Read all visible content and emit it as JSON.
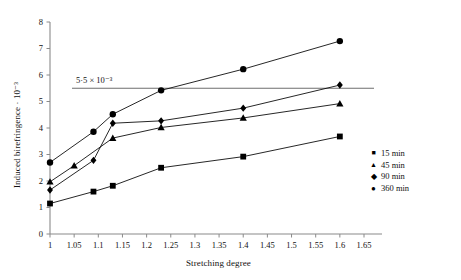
{
  "axes": {
    "ylabel": "Induced birefringence · 10⁻³",
    "xlabel": "Stretching degree",
    "yticks": [
      "0",
      "1",
      "2",
      "3",
      "4",
      "5",
      "6",
      "7",
      "8"
    ],
    "xticks": [
      "1",
      "1.05",
      "1.1",
      "1.15",
      "1.2",
      "1.25",
      "1.3",
      "1.35",
      "1.4",
      "1.45",
      "1.5",
      "1.55",
      "1.6",
      "1.65"
    ]
  },
  "annotation": {
    "reference_line_label": "5·5 × 10⁻³"
  },
  "legend": {
    "items": [
      {
        "label": "15 min",
        "marker": "square-marker"
      },
      {
        "label": "45 min",
        "marker": "triangle-marker"
      },
      {
        "label": "90 min",
        "marker": "diamond-marker"
      },
      {
        "label": "360 min",
        "marker": "circle-marker"
      }
    ]
  },
  "chart_data": {
    "type": "scatter",
    "title": "",
    "xlabel": "Stretching degree",
    "ylabel": "Induced birefringence · 10⁻³",
    "xlim": [
      1,
      1.65
    ],
    "ylim": [
      0,
      8
    ],
    "xticks": [
      1,
      1.05,
      1.1,
      1.15,
      1.2,
      1.25,
      1.3,
      1.35,
      1.4,
      1.45,
      1.5,
      1.55,
      1.6,
      1.65
    ],
    "yticks": [
      0,
      1,
      2,
      3,
      4,
      5,
      6,
      7,
      8
    ],
    "grid": false,
    "legend_position": "right-inside",
    "reference_lines": [
      {
        "orientation": "horizontal",
        "y": 5.5,
        "label": "5·5 × 10⁻³",
        "color": "#6e6e6e"
      }
    ],
    "series": [
      {
        "name": "15 min",
        "marker": "square",
        "color": "#000000",
        "points": [
          {
            "x": 1.0,
            "y": 1.15
          },
          {
            "x": 1.09,
            "y": 1.6
          },
          {
            "x": 1.13,
            "y": 1.82
          },
          {
            "x": 1.23,
            "y": 2.5
          },
          {
            "x": 1.4,
            "y": 2.92
          },
          {
            "x": 1.6,
            "y": 3.68
          }
        ]
      },
      {
        "name": "45 min",
        "marker": "triangle",
        "color": "#000000",
        "points": [
          {
            "x": 1.0,
            "y": 1.97
          },
          {
            "x": 1.05,
            "y": 2.58
          },
          {
            "x": 1.13,
            "y": 3.62
          },
          {
            "x": 1.23,
            "y": 4.02
          },
          {
            "x": 1.4,
            "y": 4.38
          },
          {
            "x": 1.6,
            "y": 4.92
          }
        ]
      },
      {
        "name": "90 min",
        "marker": "diamond",
        "color": "#000000",
        "points": [
          {
            "x": 1.0,
            "y": 1.66
          },
          {
            "x": 1.09,
            "y": 2.78
          },
          {
            "x": 1.13,
            "y": 4.18
          },
          {
            "x": 1.23,
            "y": 4.27
          },
          {
            "x": 1.4,
            "y": 4.75
          },
          {
            "x": 1.6,
            "y": 5.62
          }
        ]
      },
      {
        "name": "360 min",
        "marker": "circle",
        "color": "#000000",
        "points": [
          {
            "x": 1.0,
            "y": 2.7
          },
          {
            "x": 1.09,
            "y": 3.86
          },
          {
            "x": 1.13,
            "y": 4.52
          },
          {
            "x": 1.23,
            "y": 5.42
          },
          {
            "x": 1.4,
            "y": 6.22
          },
          {
            "x": 1.6,
            "y": 7.28
          }
        ]
      }
    ]
  }
}
